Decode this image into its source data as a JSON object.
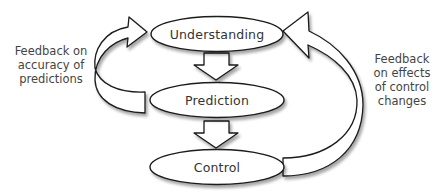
{
  "diagram": {
    "nodes": [
      {
        "id": "understanding",
        "label": "Understanding"
      },
      {
        "id": "prediction",
        "label": "Prediction"
      },
      {
        "id": "control",
        "label": "Control"
      }
    ],
    "edges": [
      {
        "from": "understanding",
        "to": "prediction",
        "style": "block-arrow-down"
      },
      {
        "from": "prediction",
        "to": "control",
        "style": "block-arrow-down"
      },
      {
        "from": "prediction",
        "to": "understanding",
        "style": "curved-block-arrow-left"
      },
      {
        "from": "control",
        "to": "understanding",
        "style": "curved-block-arrow-right"
      }
    ],
    "feedback_left": {
      "lines": [
        "Feedback on",
        "accuracy of",
        "predictions"
      ]
    },
    "feedback_right": {
      "lines": [
        "Feedback",
        "on effects",
        "of control",
        "changes"
      ]
    },
    "colors": {
      "stroke": "#1a1a1a",
      "fill": "#ffffff",
      "shadow": "#bbbbbb",
      "text": "#333333"
    }
  }
}
